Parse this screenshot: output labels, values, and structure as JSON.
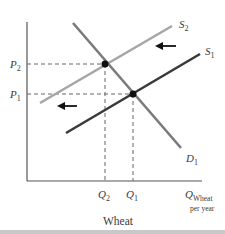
{
  "diagram": {
    "title": "Wheat",
    "type": "supply-demand",
    "axes": {
      "y_labels": [
        {
          "id": "P2",
          "letter": "P",
          "sub": "2"
        },
        {
          "id": "P1",
          "letter": "P",
          "sub": "1"
        }
      ],
      "x_labels": [
        {
          "id": "Q2",
          "letter": "Q",
          "sub": "2"
        },
        {
          "id": "Q1",
          "letter": "Q",
          "sub": "1"
        }
      ],
      "x_axis_label": {
        "letter": "Q",
        "sub": "Wheat",
        "line2": "per year"
      }
    },
    "curves": [
      {
        "id": "S2",
        "letter": "S",
        "sub": "2",
        "color": "#a6a6a6",
        "kind": "supply"
      },
      {
        "id": "S1",
        "letter": "S",
        "sub": "1",
        "color": "#3a3a3a",
        "kind": "supply"
      },
      {
        "id": "D1",
        "letter": "D",
        "sub": "1",
        "color": "#7a7a7a",
        "kind": "demand"
      }
    ],
    "equilibria": [
      {
        "id": "E2",
        "price": "P2",
        "quantity": "Q2",
        "curves": [
          "S2",
          "D1"
        ]
      },
      {
        "id": "E1",
        "price": "P1",
        "quantity": "Q1",
        "curves": [
          "S1",
          "D1"
        ]
      }
    ],
    "arrows": [
      {
        "id": "shift-arrow-upper",
        "direction": "left"
      },
      {
        "id": "shift-arrow-lower",
        "direction": "left"
      }
    ],
    "colors": {
      "axis": "#555555",
      "dashed": "#666666",
      "point": "#111111",
      "arrow": "#111111"
    }
  }
}
